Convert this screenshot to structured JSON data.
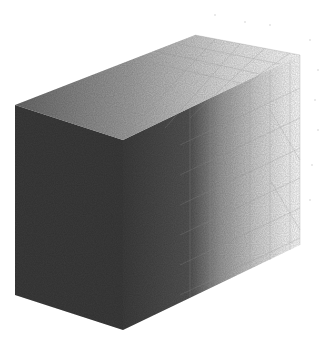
{
  "scene": {
    "subject": "faded-gradient-wireframe-box",
    "background": "#ffffff",
    "colors": {
      "dark": "#3a3a3a",
      "mid": "#8a8a8a",
      "light": "#e8e8e8",
      "wire": "#9a9a9a"
    },
    "box": {
      "front_top_left": [
        15,
        105
      ],
      "front_bottom_left": [
        15,
        295
      ],
      "front_top_right": [
        123,
        140
      ],
      "front_bottom_right": [
        123,
        330
      ],
      "back_top_left": [
        195,
        35
      ],
      "back_top_right": [
        300,
        55
      ],
      "back_bottom_right": [
        300,
        245
      ]
    }
  }
}
